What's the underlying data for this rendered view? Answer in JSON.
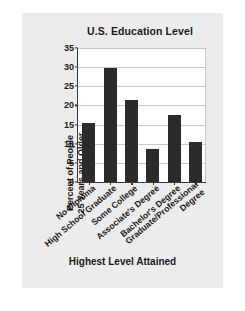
{
  "chart_data": {
    "type": "bar",
    "title": "U.S. Education Level",
    "xlabel": "Highest Level Attained",
    "ylabel": "Percent of People 25 Years and Older",
    "ylabel_lines": [
      "Percent of People",
      "25 Years and Older"
    ],
    "categories": [
      "No Diploma",
      "High School Graduate",
      "Some College",
      "Associate's Degree",
      "Bachelor's Degree",
      "Graduate/Professional Degree"
    ],
    "category_lines": [
      [
        "No Diploma"
      ],
      [
        "High School Graduate"
      ],
      [
        "Some College"
      ],
      [
        "Associate's Degree"
      ],
      [
        "Bachelor's Degree"
      ],
      [
        "Graduate/Professional",
        "Degree"
      ]
    ],
    "values": [
      15.3,
      29.8,
      21.5,
      8.7,
      17.6,
      10.4
    ],
    "ylim": [
      0,
      35
    ],
    "ytick_labels": [
      "0",
      "5",
      "10",
      "15",
      "20",
      "25",
      "30",
      "35"
    ],
    "ytick_values": [
      0,
      5,
      10,
      15,
      20,
      25,
      30,
      35
    ],
    "grid": true,
    "legend": "none",
    "bar_color": "#2b2b2b",
    "plot_background": "#ffffff",
    "figure_background": "#ececec",
    "axis_color": "#3a3a3a",
    "grid_color": "#c9c9c9",
    "text_color": "#1b1b1b"
  }
}
